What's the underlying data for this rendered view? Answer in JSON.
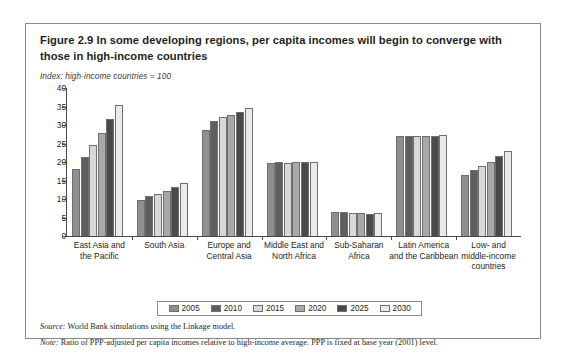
{
  "figure": {
    "title": "Figure 2.9  In some developing regions, per capita incomes will begin to converge with those in high-income countries",
    "index_note": "Index: high-income countries = 100",
    "source_label": "Source:",
    "source_text": " World Bank simulations using the Linkage model.",
    "note_label": "Note:",
    "note_text": " Ratio of PPP-adjusted per capita incomes relative to high-income average. PPP is fixed at base year (2001) level."
  },
  "chart_data": {
    "type": "bar",
    "title": "Figure 2.9  In some developing regions, per capita incomes will begin to converge with those in high-income countries",
    "xlabel": "",
    "ylabel": "Index: high-income countries = 100",
    "ylim": [
      0,
      40
    ],
    "yticks": [
      0,
      5,
      10,
      15,
      20,
      25,
      30,
      35,
      40
    ],
    "grid": false,
    "legend_position": "bottom",
    "categories": [
      "East Asia and the Pacific",
      "South Asia",
      "Europe and Central Asia",
      "Middle East and North Africa",
      "Sub-Saharan Africa",
      "Latin America and the Caribbean",
      "Low- and middle-income countries"
    ],
    "category_lines": [
      [
        "East Asia and",
        "the Pacific"
      ],
      [
        "South Asia"
      ],
      [
        "Europe and",
        "Central Asia"
      ],
      [
        "Middle East and",
        "North Africa"
      ],
      [
        "Sub-Saharan",
        "Africa"
      ],
      [
        "Latin America",
        "and the Caribbean"
      ],
      [
        "Low- and",
        "middle-income",
        "countries"
      ]
    ],
    "series": [
      {
        "name": "2005",
        "color": "#8f8f8f",
        "values": [
          18.2,
          9.8,
          28.6,
          19.7,
          6.6,
          27.0,
          16.5
        ]
      },
      {
        "name": "2010",
        "color": "#5e5e5e",
        "values": [
          21.4,
          10.7,
          31.0,
          19.9,
          6.5,
          27.0,
          17.9
        ]
      },
      {
        "name": "2015",
        "color": "#d8d8d8",
        "values": [
          24.6,
          11.4,
          32.1,
          19.8,
          6.3,
          26.9,
          19.0
        ]
      },
      {
        "name": "2020",
        "color": "#a8a8a8",
        "values": [
          27.8,
          12.3,
          32.8,
          19.9,
          6.2,
          26.9,
          20.1
        ]
      },
      {
        "name": "2025",
        "color": "#4a4a4a",
        "values": [
          31.5,
          13.3,
          33.6,
          19.9,
          6.0,
          27.0,
          21.5
        ]
      },
      {
        "name": "2030",
        "color": "#eaeaea",
        "values": [
          35.3,
          14.4,
          34.6,
          20.1,
          6.1,
          27.2,
          22.9
        ]
      }
    ]
  }
}
